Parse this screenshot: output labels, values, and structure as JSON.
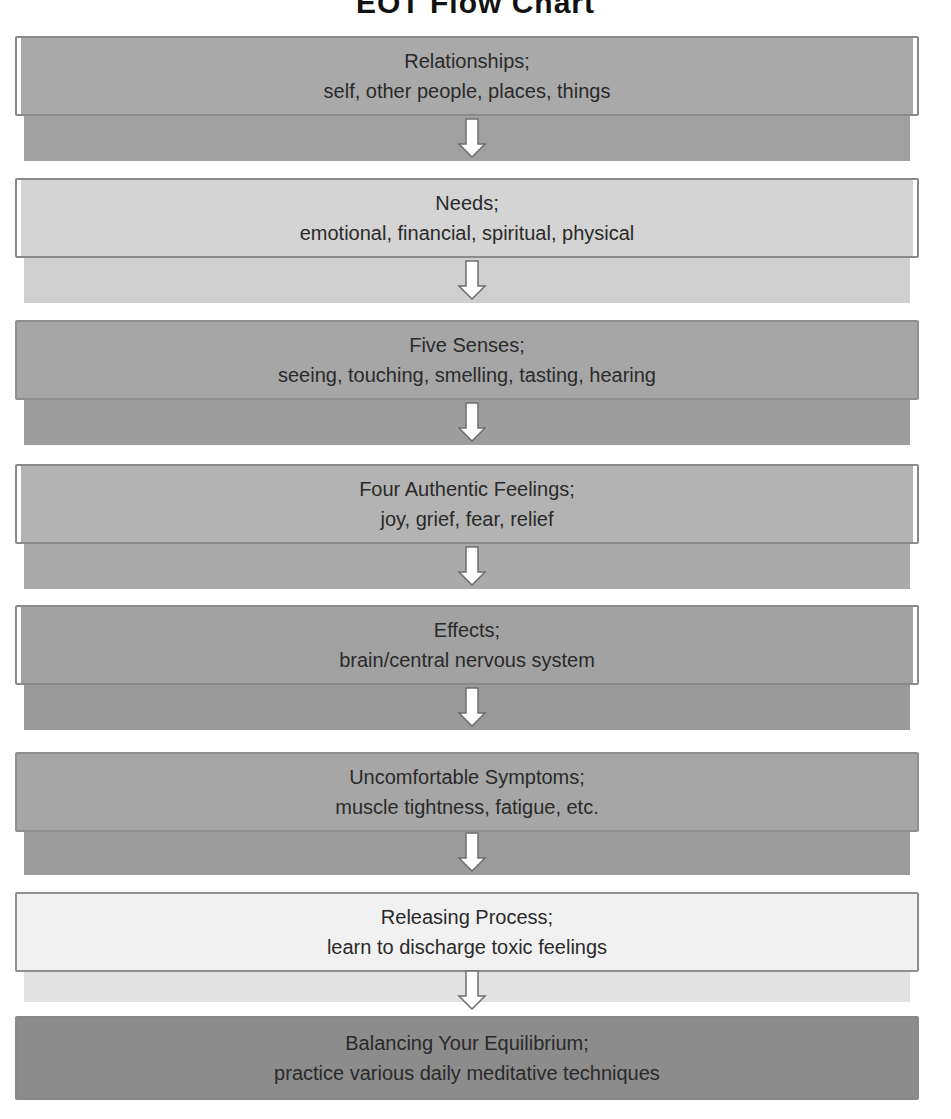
{
  "title": "EOT Flow Chart",
  "steps": [
    {
      "heading": "Relationships;",
      "detail": "self, other people, places, things",
      "fill": "#a9a9a9",
      "band": "#a0a0a0"
    },
    {
      "heading": "Needs;",
      "detail": "emotional, financial, spiritual, physical",
      "fill": "#d4d4d4",
      "band": "#cfcfcf"
    },
    {
      "heading": "Five Senses;",
      "detail": "seeing, touching, smelling, tasting, hearing",
      "fill": "#a6a6a6",
      "band": "#9e9e9e"
    },
    {
      "heading": "Four Authentic Feelings;",
      "detail": "joy, grief, fear, relief",
      "fill": "#b3b3b3",
      "band": "#aaaaaa"
    },
    {
      "heading": "Effects;",
      "detail": "brain/central nervous system",
      "fill": "#a2a2a2",
      "band": "#9a9a9a"
    },
    {
      "heading": "Uncomfortable Symptoms;",
      "detail": "muscle tightness, fatigue, etc.",
      "fill": "#a6a6a6",
      "band": "#9c9c9c"
    },
    {
      "heading": "Releasing Process;",
      "detail": "learn to discharge toxic feelings",
      "fill": "#f1f1f1",
      "band": "#e2e2e2"
    },
    {
      "heading": "Balancing Your Equilibrium;",
      "detail": "practice various daily meditative techniques",
      "fill": "#8c8c8c",
      "band": null
    }
  ],
  "arrow_icon": "down-arrow"
}
